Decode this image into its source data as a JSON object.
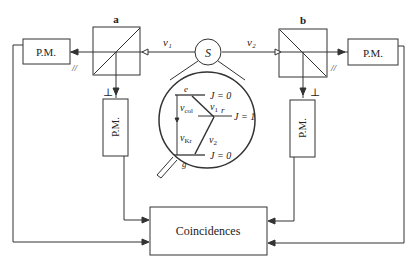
{
  "diagram": {
    "source": {
      "label": "S"
    },
    "beams": {
      "left": "ν₁",
      "right": "ν₂"
    },
    "polarizers": {
      "a": {
        "label": "a",
        "parallel": "//",
        "perp": "⊥"
      },
      "b": {
        "label": "b",
        "parallel": "//",
        "perp": "⊥"
      }
    },
    "detectors": {
      "left_parallel": "P.M.",
      "left_perp": "P.M.",
      "right_perp": "P.M.",
      "right_parallel": "P.M."
    },
    "coincidence_box": {
      "label": "Coincidences"
    },
    "level_scheme": {
      "levels": [
        {
          "name": "e",
          "J": "J = 0"
        },
        {
          "name": "r",
          "J": "J = 1"
        },
        {
          "name": "g",
          "J": "J = 0"
        }
      ],
      "transitions": {
        "nu_col": "ν",
        "nu_col_sub": "col",
        "nu_kr": "ν",
        "nu_kr_sub": "Kr",
        "nu1": "ν",
        "nu1_sub": "1",
        "nu2": "ν",
        "nu2_sub": "2"
      },
      "level_labels": {
        "e": "e",
        "r": "r",
        "g": "g",
        "j_top": "J = 0",
        "j_mid": "J = 1",
        "j_bot": "J = 0"
      }
    },
    "colors": {
      "line": "#333333",
      "background": "#ffffff"
    }
  }
}
